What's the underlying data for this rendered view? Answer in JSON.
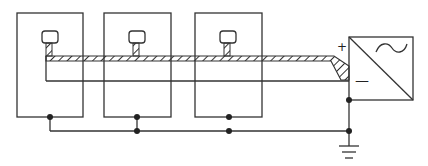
{
  "diagram": {
    "type": "circuit-schematic",
    "colors": {
      "line": "#333333",
      "background": "#ffffff"
    },
    "panels": [
      {
        "id": "panel-1",
        "sensor": "sensor-1"
      },
      {
        "id": "panel-2",
        "sensor": "sensor-2"
      },
      {
        "id": "panel-3",
        "sensor": "sensor-3"
      }
    ],
    "inverter": {
      "plus_label": "+",
      "minus_label": "—",
      "ac_symbol": "~",
      "symbol": "dc-ac-converter"
    },
    "ground": {
      "symbol": "ground"
    },
    "cable": {
      "style": "hatched-shielded"
    }
  }
}
